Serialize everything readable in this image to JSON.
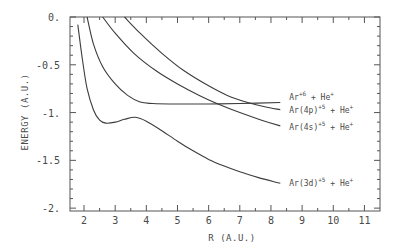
{
  "chart_data": {
    "type": "line",
    "title": "",
    "xlabel": "R (A.U.)",
    "ylabel": "ENERGY (A.U.)",
    "xlim": [
      1.55,
      11.5
    ],
    "ylim": [
      -2.03,
      0
    ],
    "xticks": [
      2,
      3,
      4,
      5,
      6,
      7,
      8,
      9,
      10,
      11
    ],
    "xtick_labels": [
      "2",
      "3",
      "4",
      "5",
      "6",
      "7",
      "8",
      "9",
      "10",
      "11"
    ],
    "yticks": [
      0,
      -0.5,
      -1,
      -1.5,
      -2
    ],
    "ytick_labels": [
      "0.",
      "-0.5",
      "-1.",
      "-1.5",
      "-2."
    ],
    "grid": false,
    "legend_position": "inline labels at right end of curves",
    "series": [
      {
        "name": "Ar+6 + He+",
        "label_base": "Ar",
        "label_sup": "+6",
        "label_rest": " + He",
        "label_rest_sup": "+",
        "x": [
          2.1,
          2.3,
          2.6,
          3.0,
          3.4,
          3.8,
          4.2,
          5.0,
          6.0,
          7.0,
          8.3
        ],
        "y": [
          0.0,
          -0.28,
          -0.52,
          -0.7,
          -0.82,
          -0.89,
          -0.905,
          -0.91,
          -0.91,
          -0.905,
          -0.895
        ]
      },
      {
        "name": "Ar(4p)+5 + He+",
        "label_base": "Ar(4p)",
        "label_sup": "+5",
        "label_rest": " + He",
        "label_rest_sup": "+",
        "x": [
          3.3,
          3.8,
          4.5,
          5.2,
          6.0,
          6.6,
          7.2,
          7.8,
          8.3
        ],
        "y": [
          0.0,
          -0.17,
          -0.38,
          -0.56,
          -0.72,
          -0.82,
          -0.89,
          -0.94,
          -0.97
        ]
      },
      {
        "name": "Ar(4s)+5 + He+",
        "label_base": "Ar(4s)",
        "label_sup": "+5",
        "label_rest": " + He",
        "label_rest_sup": "+",
        "x": [
          2.6,
          3.0,
          3.6,
          4.3,
          5.0,
          5.7,
          6.3,
          7.0,
          7.7,
          8.3
        ],
        "y": [
          0.0,
          -0.17,
          -0.38,
          -0.56,
          -0.7,
          -0.82,
          -0.91,
          -1.0,
          -1.08,
          -1.14
        ]
      },
      {
        "name": "Ar(3d)+5 + He+",
        "label_base": "Ar(3d)",
        "label_sup": "+5",
        "label_rest": " + He",
        "label_rest_sup": "+",
        "x": [
          1.8,
          1.95,
          2.1,
          2.3,
          2.5,
          2.7,
          3.0,
          3.3,
          3.65,
          4.0,
          4.5,
          5.0,
          5.5,
          6.0,
          6.5,
          7.0,
          7.6,
          8.3
        ],
        "y": [
          -0.08,
          -0.45,
          -0.75,
          -0.97,
          -1.08,
          -1.11,
          -1.1,
          -1.07,
          -1.05,
          -1.09,
          -1.19,
          -1.3,
          -1.4,
          -1.49,
          -1.56,
          -1.62,
          -1.68,
          -1.74
        ]
      }
    ]
  }
}
